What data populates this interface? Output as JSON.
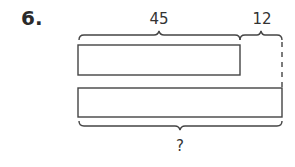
{
  "problem": {
    "number": "6."
  },
  "diagram": {
    "type": "tape-diagram",
    "top_bar": {
      "segment_label": "45",
      "extra_label": "12"
    },
    "bottom_bar": {
      "total_label": "?"
    }
  }
}
